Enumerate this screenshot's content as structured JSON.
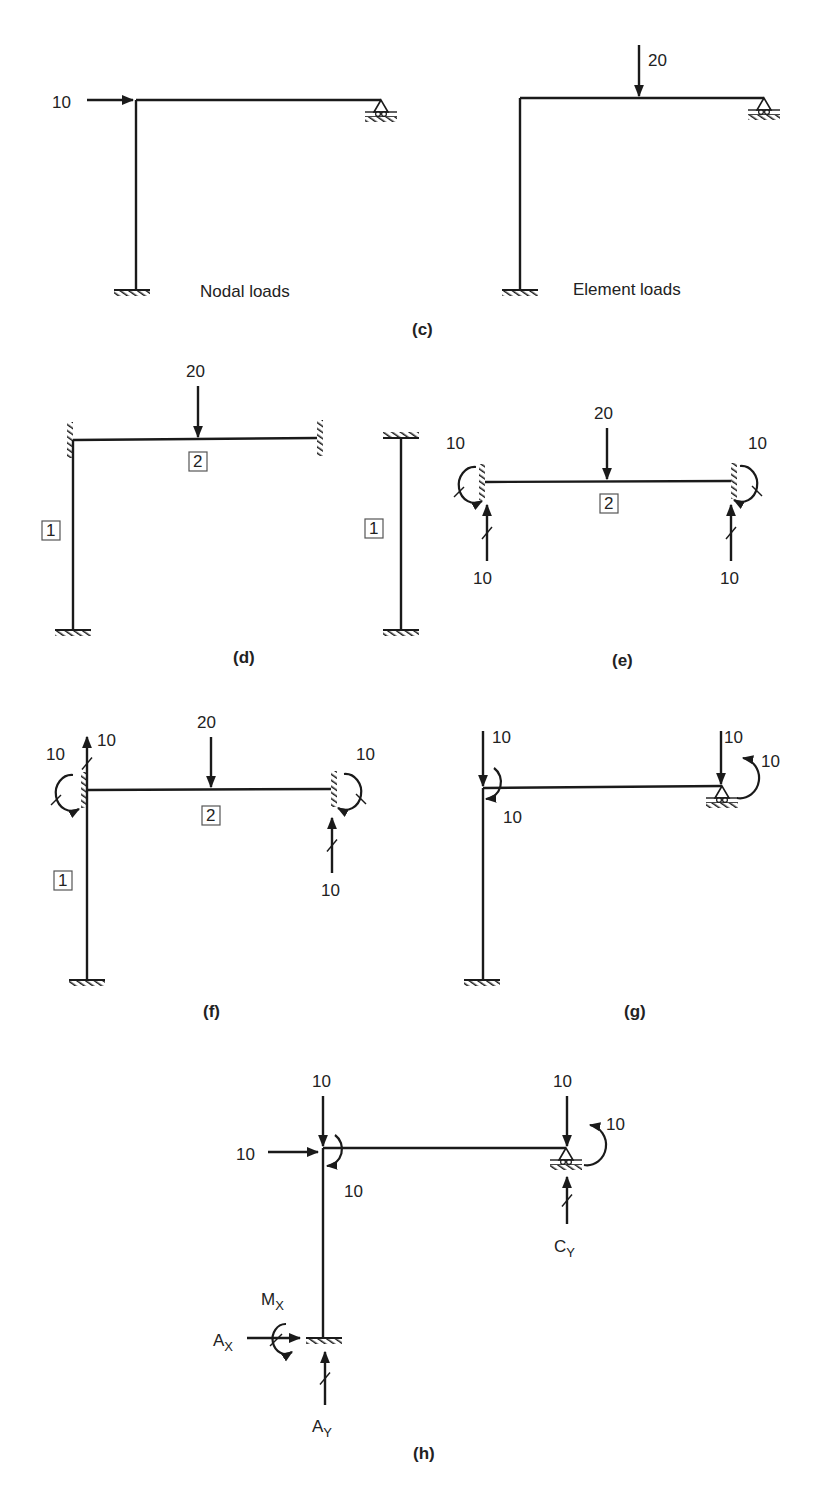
{
  "figure": {
    "panels": [
      {
        "id": "c",
        "caption": "(c)",
        "caption_pos": [
          412,
          335
        ],
        "subfigures": [
          {
            "name": "nodal-loads",
            "label": "Nodal loads",
            "label_pos": [
              200,
              297
            ],
            "members": [
              [
                136,
                100,
                136,
                290
              ],
              [
                136,
                100,
                381,
                100
              ]
            ],
            "supports": [
              {
                "type": "fixed-horizontal",
                "x": 132,
                "y": 290
              },
              {
                "type": "roller",
                "x": 381,
                "y": 100
              }
            ],
            "forces": [
              {
                "value": "10",
                "x1": 87,
                "y1": 100,
                "x2": 133,
                "y2": 100,
                "label_pos": [
                  52,
                  108
                ],
                "tick": false
              }
            ],
            "moments": []
          },
          {
            "name": "element-loads",
            "label": "Element loads",
            "label_pos": [
              573,
              295
            ],
            "members": [
              [
                520,
                98,
                520,
                290
              ],
              [
                520,
                98,
                764,
                98
              ]
            ],
            "supports": [
              {
                "type": "fixed-horizontal",
                "x": 520,
                "y": 290
              },
              {
                "type": "roller",
                "x": 764,
                "y": 98
              }
            ],
            "forces": [
              {
                "value": "20",
                "x1": 639,
                "y1": 45,
                "x2": 639,
                "y2": 96,
                "label_pos": [
                  648,
                  66
                ],
                "tick": false
              }
            ],
            "moments": []
          }
        ]
      },
      {
        "id": "d",
        "caption": "(d)",
        "caption_pos": [
          233,
          663
        ],
        "subfigures": [
          {
            "name": "frame-separated",
            "members": [
              [
                73,
                440,
                73,
                630
              ],
              [
                73,
                440,
                317,
                438
              ]
            ],
            "supports": [
              {
                "type": "fixed-vertical-left",
                "x": 70,
                "y": 440
              },
              {
                "type": "fixed-vertical-right",
                "x": 320,
                "y": 438
              },
              {
                "type": "fixed-horizontal",
                "x": 73,
                "y": 630
              }
            ],
            "forces": [
              {
                "value": "20",
                "x1": 198,
                "y1": 386,
                "x2": 198,
                "y2": 437,
                "label_pos": [
                  186,
                  377
                ],
                "tick": false
              }
            ],
            "moments": [],
            "element_boxes": [
              {
                "value": "2",
                "x": 189,
                "y": 452
              },
              {
                "value": "1",
                "x": 42,
                "y": 521
              }
            ]
          },
          {
            "name": "column-isolated",
            "members": [
              [
                401,
                438,
                401,
                630
              ]
            ],
            "supports": [
              {
                "type": "fixed-horizontal-top",
                "x": 401,
                "y": 438
              },
              {
                "type": "fixed-horizontal",
                "x": 401,
                "y": 630
              }
            ],
            "forces": [],
            "moments": [],
            "element_boxes": [
              {
                "value": "1",
                "x": 365,
                "y": 519
              }
            ]
          }
        ]
      },
      {
        "id": "e",
        "caption": "(e)",
        "caption_pos": [
          612,
          666
        ],
        "subfigures": [
          {
            "name": "beam-fixed-end-reactions",
            "members": [
              [
                485,
                482,
                731,
                481
              ]
            ],
            "supports": [
              {
                "type": "fixed-vertical-left",
                "x": 482,
                "y": 482
              },
              {
                "type": "fixed-vertical-right",
                "x": 734,
                "y": 481
              }
            ],
            "forces": [
              {
                "value": "20",
                "x1": 607,
                "y1": 428,
                "x2": 607,
                "y2": 479,
                "label_pos": [
                  594,
                  419
                ],
                "tick": false
              },
              {
                "value": "10",
                "x1": 487,
                "y1": 561,
                "x2": 487,
                "y2": 505,
                "label_pos": [
                  473,
                  584
                ],
                "tick": true
              },
              {
                "value": "10",
                "x1": 731,
                "y1": 561,
                "x2": 731,
                "y2": 505,
                "label_pos": [
                  720,
                  584
                ],
                "tick": true
              }
            ],
            "moments": [
              {
                "value": "10",
                "cx": 468,
                "cy": 487,
                "dir": "left-ccw",
                "label_pos": [
                  446,
                  449
                ]
              },
              {
                "value": "10",
                "cx": 748,
                "cy": 486,
                "dir": "right-cw",
                "label_pos": [
                  748,
                  449
                ]
              }
            ],
            "element_boxes": [
              {
                "value": "2",
                "x": 600,
                "y": 494
              }
            ]
          }
        ]
      },
      {
        "id": "f",
        "caption": "(f)",
        "caption_pos": [
          203,
          1017
        ],
        "subfigures": [
          {
            "name": "frame-with-reversed-reactions",
            "members": [
              [
                87,
                790,
                87,
                980
              ],
              [
                87,
                790,
                331,
                789
              ]
            ],
            "supports": [
              {
                "type": "fixed-vertical-left",
                "x": 84,
                "y": 790
              },
              {
                "type": "fixed-vertical-right",
                "x": 334,
                "y": 789
              },
              {
                "type": "fixed-horizontal",
                "x": 87,
                "y": 980
              }
            ],
            "forces": [
              {
                "value": "20",
                "x1": 211,
                "y1": 737,
                "x2": 211,
                "y2": 787,
                "label_pos": [
                  197,
                  728
                ],
                "tick": false
              },
              {
                "value": "10",
                "x1": 87,
                "y1": 790,
                "x2": 87,
                "y2": 737,
                "label_pos": [
                  97,
                  746
                ],
                "tick": true
              },
              {
                "value": "10",
                "x1": 332,
                "y1": 873,
                "x2": 332,
                "y2": 818,
                "label_pos": [
                  321,
                  896
                ],
                "tick": true
              }
            ],
            "moments": [
              {
                "value": "10",
                "cx": 65,
                "cy": 795,
                "dir": "left-ccw",
                "label_pos": [
                  46,
                  760
                ]
              },
              {
                "value": "10",
                "cx": 352,
                "cy": 794,
                "dir": "right-cw",
                "label_pos": [
                  356,
                  760
                ]
              }
            ],
            "element_boxes": [
              {
                "value": "2",
                "x": 202,
                "y": 806
              },
              {
                "value": "1",
                "x": 54,
                "y": 871
              }
            ]
          }
        ]
      },
      {
        "id": "g",
        "caption": "(g)",
        "caption_pos": [
          624,
          1017
        ],
        "subfigures": [
          {
            "name": "equivalent-nodal-loads",
            "members": [
              [
                483,
                788,
                483,
                980
              ],
              [
                483,
                788,
                722,
                786
              ]
            ],
            "supports": [
              {
                "type": "fixed-horizontal",
                "x": 482,
                "y": 980
              },
              {
                "type": "roller",
                "x": 722,
                "y": 786
              }
            ],
            "forces": [
              {
                "value": "10",
                "x1": 483,
                "y1": 731,
                "x2": 483,
                "y2": 786,
                "label_pos": [
                  492,
                  743
                ],
                "tick": false
              },
              {
                "value": "10",
                "x1": 721,
                "y1": 731,
                "x2": 721,
                "y2": 784,
                "label_pos": [
                  724,
                  743
                ],
                "tick": false
              }
            ],
            "moments": [
              {
                "value": "10",
                "cx": 498,
                "cy": 783,
                "dir": "node-cw",
                "label_pos": [
                  503,
                  823
                ]
              },
              {
                "value": "10",
                "cx": 745,
                "cy": 773,
                "dir": "node-ccw",
                "label_pos": [
                  761,
                  767
                ]
              }
            ]
          }
        ]
      },
      {
        "id": "h",
        "caption": "(h)",
        "caption_pos": [
          413,
          1459
        ],
        "subfigures": [
          {
            "name": "combined-loads-and-reactions",
            "members": [
              [
                323,
                1148,
                323,
                1338
              ],
              [
                323,
                1148,
                566,
                1148
              ]
            ],
            "supports": [
              {
                "type": "fixed-horizontal",
                "x": 324,
                "y": 1338
              },
              {
                "type": "roller",
                "x": 566,
                "y": 1148
              }
            ],
            "forces": [
              {
                "value": "10",
                "x1": 323,
                "y1": 1096,
                "x2": 323,
                "y2": 1146,
                "label_pos": [
                  312,
                  1087
                ],
                "tick": false
              },
              {
                "value": "10",
                "x1": 268,
                "y1": 1152,
                "x2": 318,
                "y2": 1152,
                "label_pos": [
                  236,
                  1160
                ],
                "tick": false
              },
              {
                "value": "10",
                "x1": 567,
                "y1": 1096,
                "x2": 567,
                "y2": 1146,
                "label_pos": [
                  553,
                  1087
                ],
                "tick": false
              },
              {
                "value": "C_Y",
                "x1": 567,
                "y1": 1224,
                "x2": 567,
                "y2": 1177,
                "label_pos": [
                  554,
                  1252
                ],
                "tick": true
              },
              {
                "value": "A_X",
                "x1": 247,
                "y1": 1338,
                "x2": 300,
                "y2": 1338,
                "label_pos": [
                  213,
                  1346
                ],
                "tick": false
              },
              {
                "value": "A_Y",
                "x1": 325,
                "y1": 1405,
                "x2": 325,
                "y2": 1352,
                "label_pos": [
                  312,
                  1432
                ],
                "tick": true
              }
            ],
            "moments": [
              {
                "value": "10",
                "cx": 339,
                "cy": 1150,
                "dir": "node-cw",
                "label_pos": [
                  344,
                  1197
                ]
              },
              {
                "value": "10",
                "cx": 592,
                "cy": 1140,
                "dir": "node-ccw",
                "label_pos": [
                  606,
                  1130
                ]
              },
              {
                "value": "M_X",
                "cx": 276,
                "cy": 1340,
                "dir": "left-ccw-small",
                "label_pos": [
                  261,
                  1305
                ]
              }
            ]
          }
        ]
      }
    ]
  }
}
